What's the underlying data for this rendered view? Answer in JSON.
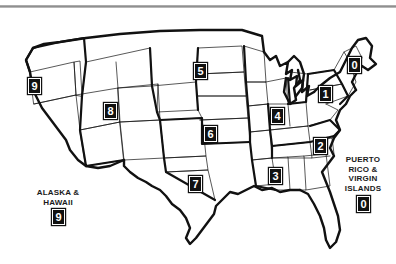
{
  "figure": {
    "background_color": "#ffffff",
    "line_color": "#111111",
    "badge_background": "#111111",
    "badge_text_color": "#ffffff",
    "rule_color": "#9a9a9a"
  },
  "badges": [
    {
      "id": "badge-9-west",
      "label": "9",
      "x": 28,
      "y": 78,
      "region": "west-coast"
    },
    {
      "id": "badge-8",
      "label": "8",
      "x": 104,
      "y": 103,
      "region": "great-plains"
    },
    {
      "id": "badge-5-north",
      "label": "5",
      "x": 194,
      "y": 63,
      "region": "upper-midwest"
    },
    {
      "id": "badge-6",
      "label": "6",
      "x": 204,
      "y": 126,
      "region": "central-plains"
    },
    {
      "id": "badge-7",
      "label": "7",
      "x": 189,
      "y": 176,
      "region": "south-central"
    },
    {
      "id": "badge-4",
      "label": "4",
      "x": 271,
      "y": 108,
      "region": "ohio-valley"
    },
    {
      "id": "badge-3",
      "label": "3",
      "x": 269,
      "y": 168,
      "region": "deep-south"
    },
    {
      "id": "badge-2",
      "label": "2",
      "x": 314,
      "y": 138,
      "region": "mid-atlantic"
    },
    {
      "id": "badge-1",
      "label": "1",
      "x": 319,
      "y": 86,
      "region": "new-york"
    },
    {
      "id": "badge-0-newengland",
      "label": "0",
      "x": 348,
      "y": 57,
      "region": "new-england"
    }
  ],
  "territory_labels": [
    {
      "id": "alaska-hawaii",
      "text": "ALASKA &\nHAWAII",
      "x": 28,
      "y": 188,
      "width": 60,
      "badge": "9",
      "badge_x": 50,
      "badge_y": 209
    },
    {
      "id": "puerto-rico-virgin-islands",
      "text": "PUERTO\nRICO &\nVIRGIN\nISLANDS",
      "x": 335,
      "y": 155,
      "width": 56,
      "badge": "0",
      "badge_x": 357,
      "badge_y": 196
    }
  ]
}
